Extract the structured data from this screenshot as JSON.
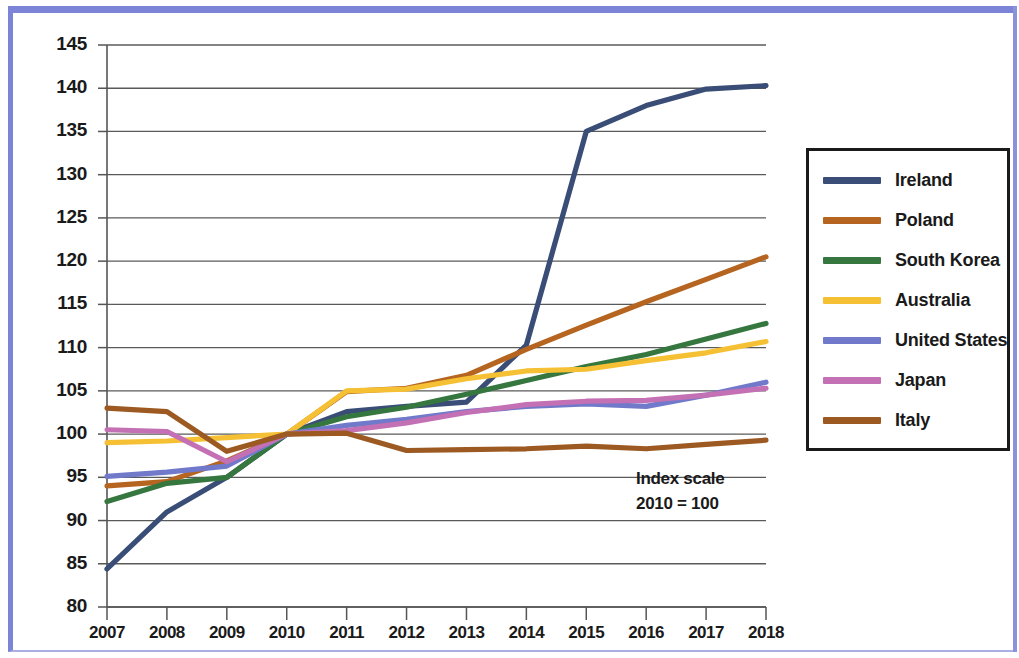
{
  "chart_data": {
    "type": "line",
    "title": "",
    "subtitle": "",
    "xlabel": "",
    "ylabel": "",
    "annotation": "Index scale\n2010 = 100",
    "annotation_line1": "Index scale",
    "annotation_line2": "2010 = 100",
    "grid": true,
    "legend_position": "right",
    "xlim": [
      2007,
      2018
    ],
    "ylim": [
      80,
      145
    ],
    "ytick_step": 5,
    "x": [
      2007,
      2008,
      2009,
      2010,
      2011,
      2012,
      2013,
      2014,
      2015,
      2016,
      2017,
      2018
    ],
    "categories": [
      "2007",
      "2008",
      "2009",
      "2010",
      "2011",
      "2012",
      "2013",
      "2014",
      "2015",
      "2016",
      "2017",
      "2018"
    ],
    "yticks": [
      80,
      85,
      90,
      95,
      100,
      105,
      110,
      115,
      120,
      125,
      130,
      135,
      140,
      145
    ],
    "ytick_labels": [
      "80",
      "85",
      "90",
      "95",
      "100",
      "105",
      "110",
      "115",
      "120",
      "125",
      "130",
      "135",
      "140",
      "145"
    ],
    "series": [
      {
        "name": "Ireland",
        "color": "#394d76",
        "values": [
          84.4,
          91.0,
          95.0,
          100.0,
          102.6,
          103.2,
          103.7,
          110.3,
          135.0,
          138.0,
          139.9,
          140.3
        ]
      },
      {
        "name": "Poland",
        "color": "#b5651f",
        "values": [
          94.0,
          94.5,
          96.9,
          100.0,
          104.9,
          105.3,
          106.8,
          109.8,
          112.6,
          115.3,
          117.9,
          120.5
        ]
      },
      {
        "name": "South Korea",
        "color": "#35773f",
        "values": [
          92.2,
          94.3,
          95.0,
          100.0,
          102.0,
          103.1,
          104.6,
          106.2,
          107.8,
          109.2,
          111.0,
          112.8
        ]
      },
      {
        "name": "Australia",
        "color": "#f5c033",
        "values": [
          99.0,
          99.2,
          99.6,
          100.0,
          105.0,
          105.2,
          106.4,
          107.3,
          107.5,
          108.5,
          109.4,
          110.7
        ]
      },
      {
        "name": "United States",
        "color": "#7179ca",
        "values": [
          95.1,
          95.6,
          96.3,
          100.0,
          101.0,
          101.7,
          102.6,
          103.2,
          103.5,
          103.2,
          104.5,
          106.0
        ]
      },
      {
        "name": "Japan",
        "color": "#c470b4",
        "values": [
          100.5,
          100.3,
          96.8,
          100.0,
          100.4,
          101.3,
          102.5,
          103.4,
          103.8,
          103.9,
          104.5,
          105.3
        ]
      },
      {
        "name": "Italy",
        "color": "#9c5a22",
        "values": [
          103.0,
          102.6,
          98.0,
          100.0,
          100.1,
          98.1,
          98.2,
          98.3,
          98.6,
          98.3,
          98.8,
          99.3
        ]
      }
    ]
  },
  "legend": {
    "items": [
      {
        "label": "Ireland",
        "color": "#394d76"
      },
      {
        "label": "Poland",
        "color": "#b5651f"
      },
      {
        "label": "South Korea",
        "color": "#35773f"
      },
      {
        "label": "Australia",
        "color": "#f5c033"
      },
      {
        "label": "United States",
        "color": "#7179ca"
      },
      {
        "label": "Japan",
        "color": "#c470b4"
      },
      {
        "label": "Italy",
        "color": "#9c5a22"
      }
    ]
  },
  "colors": {
    "frame": "#7b84d6",
    "axis": "#555555",
    "grid": "#5a5a5a",
    "text": "#1a1a1a",
    "background": "#ffffff"
  }
}
